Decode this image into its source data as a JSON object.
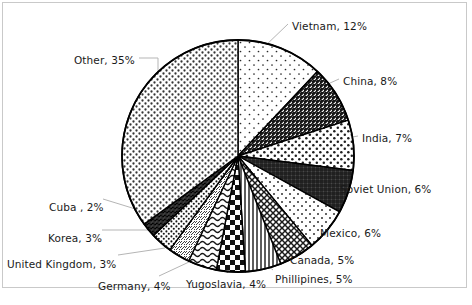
{
  "chart_data": {
    "type": "pie",
    "title": "",
    "legend_position": "none",
    "labels_show_percent": true,
    "start_angle_deg": 0,
    "direction": "clockwise",
    "categories": [
      "Vietnam",
      "China",
      "India",
      "Soviet Union",
      "Mexico",
      "Canada",
      "Phillipines",
      "Yugoslavia",
      "Germany",
      "United Kingdom",
      "Korea",
      "Cuba ",
      "Other"
    ],
    "values": [
      12,
      8,
      7,
      6,
      6,
      5,
      5,
      4,
      4,
      3,
      3,
      2,
      35
    ],
    "unit": "%",
    "slices": [
      {
        "name": "Vietnam",
        "value": 12,
        "label": "Vietnam, 12%",
        "pattern": "sparse-dots",
        "label_x": 292,
        "label_y": 21,
        "anchor": "start"
      },
      {
        "name": "China",
        "value": 8,
        "label": "China, 8%",
        "pattern": "dense-diagonal-hatch",
        "label_x": 343,
        "label_y": 76,
        "anchor": "start"
      },
      {
        "name": "India",
        "value": 7,
        "label": "India, 7%",
        "pattern": "medium-dots",
        "label_x": 362,
        "label_y": 133,
        "anchor": "start"
      },
      {
        "name": "Soviet Union",
        "value": 6,
        "label": "Soviet Union, 6%",
        "pattern": "dark-grid",
        "label_x": 340,
        "label_y": 184,
        "anchor": "start"
      },
      {
        "name": "Mexico",
        "value": 6,
        "label": "Mexico, 6%",
        "pattern": "light-dots",
        "label_x": 320,
        "label_y": 228,
        "anchor": "start"
      },
      {
        "name": "Canada",
        "value": 5,
        "label": "Canada, 5%",
        "pattern": "crosshatch-grid",
        "label_x": 290,
        "label_y": 255,
        "anchor": "start"
      },
      {
        "name": "Phillipines",
        "value": 5,
        "label": "Phillipines, 5%",
        "pattern": "vertical-stripes",
        "label_x": 275,
        "label_y": 274,
        "anchor": "start"
      },
      {
        "name": "Yugoslavia",
        "value": 4,
        "label": "Yugoslavia, 4%",
        "pattern": "bold-checkerboard",
        "label_x": 186,
        "label_y": 279,
        "anchor": "start"
      },
      {
        "name": "Germany",
        "value": 4,
        "label": "Germany, 4%",
        "pattern": "wavy-lines",
        "label_x": 98,
        "label_y": 281,
        "anchor": "start"
      },
      {
        "name": "United Kingdom",
        "value": 3,
        "label": "United Kingdom, 3%",
        "pattern": "fine-texture",
        "label_x": 7,
        "label_y": 259,
        "anchor": "start"
      },
      {
        "name": "Korea",
        "value": 3,
        "label": "Korea, 3%",
        "pattern": "small-dots",
        "label_x": 48,
        "label_y": 233,
        "anchor": "start"
      },
      {
        "name": "Cuba ",
        "value": 2,
        "label": "Cuba , 2%",
        "pattern": "dark-solid-hatch",
        "label_x": 49,
        "label_y": 202,
        "anchor": "start"
      },
      {
        "name": "Other",
        "value": 35,
        "label": "Other, 35%",
        "pattern": "medium-stipple",
        "label_x": 74,
        "label_y": 55,
        "anchor": "start"
      }
    ],
    "geometry": {
      "center_x": 238,
      "center_y": 156,
      "radius": 116
    },
    "colors": {
      "outline": "#000000",
      "fill_base": "#ffffff",
      "pattern_ink": "#1a1a1a",
      "leader_line": "#b5b5b5",
      "frame_border": "#c9c9c9",
      "background": "#ffffff",
      "label_text": "#1a1a1a"
    }
  }
}
